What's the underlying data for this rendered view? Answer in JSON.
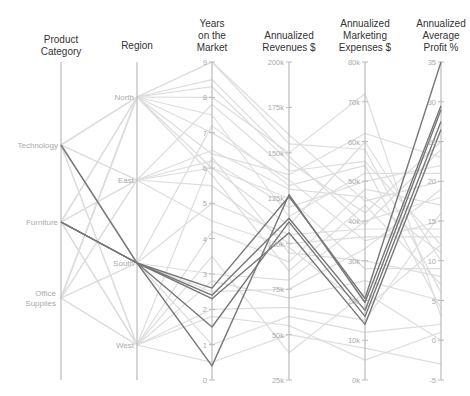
{
  "chart_data": {
    "type": "parallel_coordinates",
    "title": "",
    "axes": [
      {
        "key": "category",
        "label": "Product Category",
        "label_lines": [
          "Product",
          "Category"
        ],
        "kind": "categorical",
        "categories": [
          "Technology",
          "Furniture",
          "Office Supplies"
        ]
      },
      {
        "key": "region",
        "label": "Region",
        "label_lines": [
          "Region"
        ],
        "kind": "categorical",
        "categories": [
          "North",
          "East",
          "South",
          "West"
        ]
      },
      {
        "key": "years",
        "label": "Years on the Market",
        "label_lines": [
          "Years",
          "on the",
          "Market"
        ],
        "kind": "linear",
        "range": [
          0,
          9
        ],
        "ticks": [
          0,
          1,
          2,
          3,
          4,
          5,
          6,
          7,
          8,
          9
        ],
        "tick_labels": [
          "0",
          "1",
          "2",
          "3",
          "4",
          "5",
          "6",
          "7",
          "8",
          "9"
        ]
      },
      {
        "key": "revenue",
        "label": "Annualized Revenues $",
        "label_lines": [
          "Annualized",
          "Revenues $"
        ],
        "kind": "linear",
        "range": [
          25,
          200
        ],
        "ticks": [
          25,
          50,
          75,
          100,
          125,
          150,
          175,
          200
        ],
        "tick_labels": [
          "25k",
          "50k",
          "75k",
          "100k",
          "125k",
          "150k",
          "175k",
          "200k"
        ]
      },
      {
        "key": "marketing",
        "label": "Annualized Marketing Expenses $",
        "label_lines": [
          "Annualized",
          "Marketing",
          "Expenses $"
        ],
        "kind": "linear",
        "range": [
          0,
          80
        ],
        "ticks": [
          0,
          10,
          20,
          30,
          40,
          50,
          60,
          70,
          80
        ],
        "tick_labels": [
          "0k",
          "10k",
          "20k",
          "30k",
          "40k",
          "50k",
          "60k",
          "70k",
          "80k"
        ]
      },
      {
        "key": "profit",
        "label": "Annualized Average Profit %",
        "label_lines": [
          "Annualized",
          "Average",
          "Profit %"
        ],
        "kind": "linear",
        "range": [
          -5,
          35
        ],
        "ticks": [
          -5,
          0,
          5,
          10,
          15,
          20,
          25,
          30,
          35
        ],
        "tick_labels": [
          "-5",
          "0",
          "5",
          "10",
          "15",
          "20",
          "25",
          "30",
          "35"
        ]
      }
    ],
    "highlighted_series": [
      {
        "category": "Technology",
        "region": "South",
        "years": 2.6,
        "revenue": 126,
        "marketing": 20.5,
        "profit": 35
      },
      {
        "category": "Furniture",
        "region": "South",
        "years": 0.4,
        "revenue": 127,
        "marketing": 19.5,
        "profit": 29.5
      },
      {
        "category": "Furniture",
        "region": "South",
        "years": 2.4,
        "revenue": 114,
        "marketing": 17.5,
        "profit": 29.0
      },
      {
        "category": "Furniture",
        "region": "South",
        "years": 1.5,
        "revenue": 112,
        "marketing": 16.0,
        "profit": 27.5
      },
      {
        "category": "Furniture",
        "region": "South",
        "years": 2.3,
        "revenue": 106,
        "marketing": 14.0,
        "profit": 26.5
      }
    ],
    "background_series": [
      {
        "category": "Technology",
        "region": "North",
        "years": 9.0,
        "revenue": 160,
        "marketing": 45,
        "profit": 20
      },
      {
        "category": "Technology",
        "region": "East",
        "years": 7.8,
        "revenue": 140,
        "marketing": 55,
        "profit": 12
      },
      {
        "category": "Technology",
        "region": "West",
        "years": 6.3,
        "revenue": 95,
        "marketing": 30,
        "profit": 8
      },
      {
        "category": "Technology",
        "region": "North",
        "years": 8.0,
        "revenue": 150,
        "marketing": 72,
        "profit": 3
      },
      {
        "category": "Technology",
        "region": "South",
        "years": 3.0,
        "revenue": 80,
        "marketing": 40,
        "profit": 18
      },
      {
        "category": "Technology",
        "region": "East",
        "years": 6.2,
        "revenue": 120,
        "marketing": 50,
        "profit": 22
      },
      {
        "category": "Furniture",
        "region": "North",
        "years": 7.0,
        "revenue": 135,
        "marketing": 35,
        "profit": 15
      },
      {
        "category": "Furniture",
        "region": "East",
        "years": 6.0,
        "revenue": 110,
        "marketing": 60,
        "profit": 10
      },
      {
        "category": "Furniture",
        "region": "West",
        "years": 2.8,
        "revenue": 70,
        "marketing": 25,
        "profit": 5
      },
      {
        "category": "Furniture",
        "region": "North",
        "years": 8.3,
        "revenue": 145,
        "marketing": 42,
        "profit": 25
      },
      {
        "category": "Furniture",
        "region": "South",
        "years": 1.0,
        "revenue": 60,
        "marketing": 12,
        "profit": 2
      },
      {
        "category": "Furniture",
        "region": "West",
        "years": 4.2,
        "revenue": 90,
        "marketing": 48,
        "profit": 17
      },
      {
        "category": "Furniture",
        "region": "East",
        "years": 5.5,
        "revenue": 100,
        "marketing": 36,
        "profit": 13
      },
      {
        "category": "Office Supplies",
        "region": "North",
        "years": 9.0,
        "revenue": 155,
        "marketing": 58,
        "profit": 6
      },
      {
        "category": "Office Supplies",
        "region": "South",
        "years": 2.5,
        "revenue": 75,
        "marketing": 33,
        "profit": 19
      },
      {
        "category": "Office Supplies",
        "region": "West",
        "years": 0.5,
        "revenue": 50,
        "marketing": 8,
        "profit": -3
      },
      {
        "category": "Office Supplies",
        "region": "East",
        "years": 6.5,
        "revenue": 130,
        "marketing": 46,
        "profit": 11
      },
      {
        "category": "Office Supplies",
        "region": "North",
        "years": 7.5,
        "revenue": 115,
        "marketing": 52,
        "profit": 21
      },
      {
        "category": "Office Supplies",
        "region": "West",
        "years": 3.5,
        "revenue": 40,
        "marketing": 22,
        "profit": 0
      },
      {
        "category": "Office Supplies",
        "region": "South",
        "years": 5.0,
        "revenue": 105,
        "marketing": 38,
        "profit": 14
      },
      {
        "category": "Office Supplies",
        "region": "North",
        "years": 6.0,
        "revenue": 125,
        "marketing": 28,
        "profit": 9
      },
      {
        "category": "Technology",
        "region": "West",
        "years": 2.0,
        "revenue": 65,
        "marketing": 15,
        "profit": 16
      },
      {
        "category": "Technology",
        "region": "North",
        "years": 6.4,
        "revenue": 138,
        "marketing": 62,
        "profit": 23
      },
      {
        "category": "Furniture",
        "region": "North",
        "years": 5.8,
        "revenue": 85,
        "marketing": 44,
        "profit": 7
      },
      {
        "category": "Office Supplies",
        "region": "East",
        "years": 4.5,
        "revenue": 98,
        "marketing": 18,
        "profit": 12
      },
      {
        "category": "Technology",
        "region": "South",
        "years": 7.2,
        "revenue": 132,
        "marketing": 54,
        "profit": 4
      },
      {
        "category": "Furniture",
        "region": "West",
        "years": 1.8,
        "revenue": 55,
        "marketing": 5,
        "profit": 1
      },
      {
        "category": "Office Supplies",
        "region": "North",
        "years": 8.5,
        "revenue": 148,
        "marketing": 39,
        "profit": 24
      }
    ],
    "colors": {
      "highlight": "#777777",
      "background": "#dddddd",
      "axis": "#bbbbbb",
      "text": "#333333",
      "tick_text": "#aaaaaa"
    },
    "legend": null,
    "grid": false
  }
}
